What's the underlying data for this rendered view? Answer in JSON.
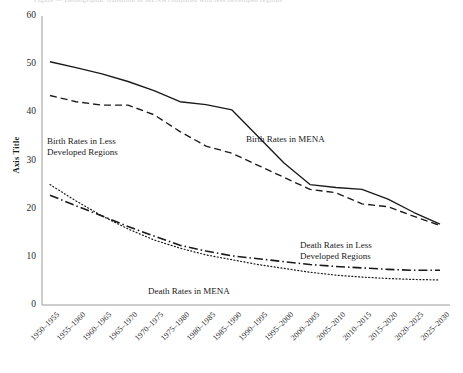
{
  "figure": {
    "clipped_caption": "Figure — Demographic transition in MENA compared with less developed regions",
    "axis_title_y": "Axis Title",
    "background_color": "#ffffff",
    "line_color": "#1a1a1a"
  },
  "chart_data": {
    "type": "line",
    "title": "",
    "xlabel": "",
    "ylabel": "Axis Title",
    "ylim": [
      0,
      60
    ],
    "yticks": [
      0,
      10,
      20,
      30,
      40,
      50,
      60
    ],
    "grid": false,
    "legend_position": "inline-annotations",
    "categories": [
      "1950-1955",
      "1955-1960",
      "1960-1965",
      "1965-1970",
      "1970-1975",
      "1975-1980",
      "1980-1985",
      "1985-1990",
      "1990-1995",
      "1995-2000",
      "2000-2005",
      "2005-2010",
      "2010-2015",
      "2015-2020",
      "2020-2025",
      "2025-2030"
    ],
    "series": [
      {
        "name": "Birth Rates in MENA",
        "style": "solid",
        "values": [
          50.5,
          49.3,
          48.0,
          46.4,
          44.5,
          42.2,
          41.6,
          40.5,
          35.0,
          29.5,
          25.0,
          24.4,
          24.0,
          22.0,
          19.2,
          16.8
        ]
      },
      {
        "name": "Birth Rates in Less Developed Regions",
        "style": "dashed",
        "values": [
          43.5,
          42.2,
          41.5,
          41.5,
          39.5,
          36.0,
          33.0,
          31.5,
          29.0,
          26.5,
          24.0,
          23.3,
          21.0,
          20.4,
          18.4,
          16.5
        ]
      },
      {
        "name": "Death Rates in Less Developed Regions",
        "style": "dash-dot",
        "values": [
          22.8,
          20.6,
          18.5,
          16.3,
          14.3,
          12.4,
          11.2,
          10.2,
          9.6,
          9.0,
          8.4,
          8.0,
          7.7,
          7.4,
          7.2,
          7.2
        ]
      },
      {
        "name": "Death Rates in MENA",
        "style": "dotted",
        "values": [
          25.0,
          21.6,
          18.5,
          15.8,
          13.5,
          11.8,
          10.4,
          9.4,
          8.4,
          7.6,
          6.8,
          6.2,
          5.8,
          5.5,
          5.3,
          5.2
        ]
      }
    ],
    "annotations": [
      {
        "id": "ann-birth-ldr",
        "text_line1": "Birth Rates in Less",
        "text_line2": "Developed Regions",
        "x": 47,
        "y": 136
      },
      {
        "id": "ann-birth-mena",
        "text_line1": "Birth Rates in MENA",
        "text_line2": "",
        "x": 246,
        "y": 134
      },
      {
        "id": "ann-death-ldr",
        "text_line1": "Death Rates in Less",
        "text_line2": "Developed Regions",
        "x": 300,
        "y": 240
      },
      {
        "id": "ann-death-mena",
        "text_line1": "Death Rates in MENA",
        "text_line2": "",
        "x": 148,
        "y": 286
      }
    ]
  }
}
